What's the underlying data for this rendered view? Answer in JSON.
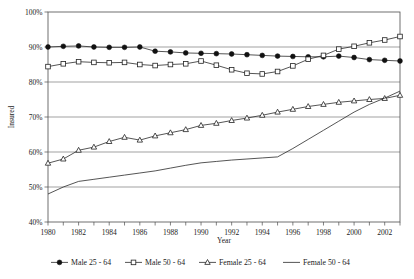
{
  "chart_data": {
    "type": "line",
    "title": "",
    "xlabel": "Year",
    "ylabel": "Insured",
    "xlim": [
      1980,
      2003
    ],
    "ylim": [
      40,
      100
    ],
    "ytick_labels": [
      "100%",
      "90%",
      "80%",
      "70%",
      "60%",
      "50%",
      "40%"
    ],
    "ytick_values": [
      100,
      90,
      80,
      70,
      60,
      50,
      40
    ],
    "grid": true,
    "legend_position": "bottom",
    "x": [
      1980,
      1981,
      1982,
      1983,
      1984,
      1985,
      1986,
      1987,
      1988,
      1989,
      1990,
      1991,
      1992,
      1993,
      1994,
      1995,
      1996,
      1997,
      1998,
      1999,
      2000,
      2001,
      2002,
      2003
    ],
    "xtick_labels": [
      "1980",
      "1982",
      "1984",
      "1986",
      "1988",
      "1990",
      "1992",
      "1994",
      "1996",
      "1998",
      "2000",
      "2002"
    ],
    "xtick_label_values": [
      1980,
      1982,
      1984,
      1986,
      1988,
      1990,
      1992,
      1994,
      1996,
      1998,
      2000,
      2002
    ],
    "series": [
      {
        "name": "Male 25 - 64",
        "marker": "filled-circle",
        "values": [
          90.0,
          90.2,
          90.3,
          90.0,
          89.9,
          89.9,
          90.0,
          88.8,
          88.6,
          88.3,
          88.2,
          88.1,
          88.0,
          87.8,
          87.6,
          87.4,
          87.3,
          87.2,
          87.2,
          87.4,
          87.0,
          86.4,
          86.2,
          86.0
        ]
      },
      {
        "name": "Male 50 - 64",
        "marker": "open-square",
        "values": [
          84.4,
          85.2,
          85.8,
          85.6,
          85.5,
          85.6,
          85.0,
          84.7,
          85.0,
          85.2,
          86.0,
          84.8,
          83.5,
          82.5,
          82.3,
          83.0,
          84.6,
          86.5,
          87.6,
          89.4,
          90.2,
          91.2,
          92.0,
          93.0
        ]
      },
      {
        "name": "Female 25 - 64",
        "marker": "open-triangle",
        "values": [
          56.8,
          58.0,
          60.5,
          61.4,
          63.0,
          64.2,
          63.4,
          64.6,
          65.5,
          66.4,
          67.6,
          68.2,
          69.0,
          69.7,
          70.5,
          71.4,
          72.2,
          73.0,
          73.6,
          74.2,
          74.6,
          75.0,
          75.3,
          76.2
        ]
      },
      {
        "name": "Female 50 - 64",
        "marker": "line-only",
        "values": [
          48.0,
          50.0,
          51.6,
          52.2,
          52.8,
          53.4,
          54.0,
          54.6,
          55.4,
          56.2,
          56.9,
          57.3,
          57.7,
          58.0,
          58.3,
          58.6,
          61.0,
          63.6,
          66.2,
          68.8,
          71.4,
          73.6,
          75.4,
          77.4
        ]
      }
    ]
  }
}
